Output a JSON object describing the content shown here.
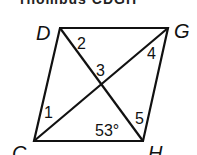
{
  "title_cropped": "rhombus CDGH",
  "diagram": {
    "shape": "rhombus",
    "vertices": {
      "D": {
        "label": "D",
        "x": 60,
        "y": 28
      },
      "G": {
        "label": "G",
        "x": 168,
        "y": 28
      },
      "H": {
        "label": "H",
        "x": 143,
        "y": 141
      },
      "C": {
        "label": "C",
        "x": 34,
        "y": 141
      }
    },
    "angle_labels": {
      "a1": "1",
      "a2": "2",
      "a3": "3",
      "a4": "4",
      "a5": "5",
      "given": "53°"
    },
    "stroke_color": "#111111"
  }
}
